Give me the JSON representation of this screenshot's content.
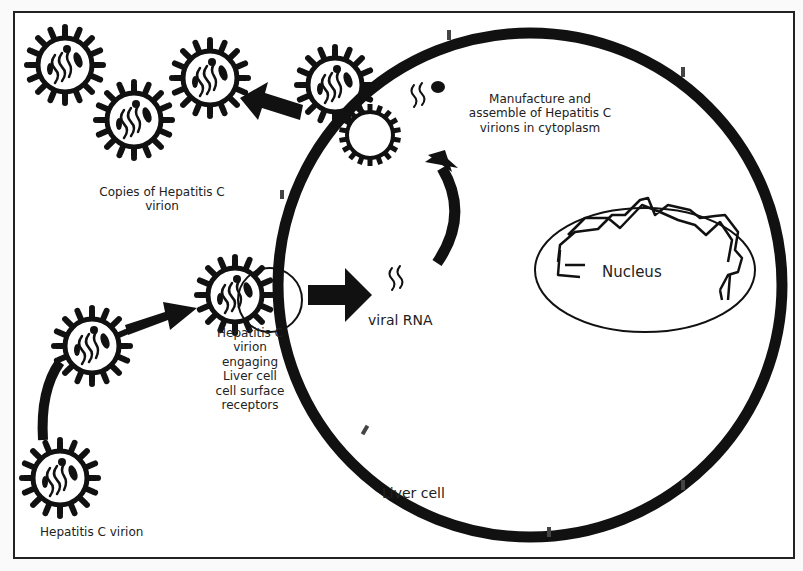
{
  "diagram": {
    "colors": {
      "ink": "#111111",
      "paper": "#ffffff",
      "background": "#fafafa"
    },
    "labels": {
      "copies_virion": [
        "Copies of Hepatitis C",
        "virion"
      ],
      "manufacture": [
        "Manufacture and",
        "assemble of Hepatitis C",
        "virions in cytoplasm"
      ],
      "nucleus": "Nucleus",
      "viral_rna": "viral RNA",
      "engaging": [
        "Hepatitis C",
        "virion",
        "engaging",
        "Liver cell",
        "cell surface",
        "receptors"
      ],
      "liver_cell": "Liver cell",
      "virion": "Hepatitis C  virion"
    },
    "nodes": [
      {
        "id": "virion-free",
        "label": "Hepatitis C virion"
      },
      {
        "id": "virion-engaging",
        "label": "Hepatitis C virion engaging Liver cell cell surface receptors"
      },
      {
        "id": "viral-rna",
        "label": "viral RNA"
      },
      {
        "id": "assembly",
        "label": "Manufacture and assemble of Hepatitis C virions in cytoplasm"
      },
      {
        "id": "copies",
        "label": "Copies of Hepatitis C virion"
      },
      {
        "id": "nucleus",
        "label": "Nucleus"
      },
      {
        "id": "liver-cell",
        "label": "Liver cell"
      }
    ],
    "edges": [
      {
        "from": "virion-free",
        "to": "virion-engaging"
      },
      {
        "from": "virion-engaging",
        "to": "viral-rna"
      },
      {
        "from": "viral-rna",
        "to": "assembly"
      },
      {
        "from": "assembly",
        "to": "copies"
      },
      {
        "from": "virion-free",
        "to": "virion-free",
        "note": "curved arrow from lower-left virion upward"
      }
    ]
  }
}
